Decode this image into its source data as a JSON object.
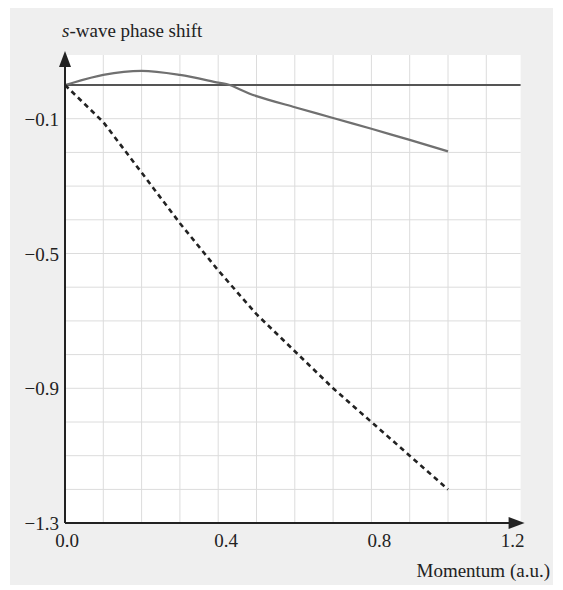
{
  "chart_data": {
    "type": "line",
    "title": "",
    "ylabel": "s-wave phase shift",
    "ylabel_italic_prefix": "s",
    "ylabel_rest": "-wave phase shift",
    "xlabel": "Momentum (a.u.)",
    "xlim": [
      0.0,
      1.2
    ],
    "ylim": [
      -1.3,
      0.05
    ],
    "x_ticks": [
      0.0,
      0.4,
      0.8,
      1.2
    ],
    "x_tick_labels": [
      "0.0",
      "0.4",
      "0.8",
      "1.2"
    ],
    "y_ticks": [
      -0.1,
      -0.5,
      -0.9,
      -1.3
    ],
    "y_tick_labels": [
      "−0.1",
      "−0.5",
      "−0.9",
      "−1.3"
    ],
    "grid": true,
    "grid_x_step": 0.1,
    "grid_y_step": 0.1,
    "legend": null,
    "series": [
      {
        "name": "zero reference",
        "style": "solid",
        "color": "#555555",
        "x": [
          0.0,
          1.2
        ],
        "y": [
          0.0,
          0.0
        ]
      },
      {
        "name": "solid curve",
        "style": "solid",
        "color": "#707070",
        "x": [
          0.0,
          0.1,
          0.2,
          0.3,
          0.4,
          0.43,
          0.5,
          0.6,
          0.7,
          0.8,
          0.9,
          1.0
        ],
        "y": [
          0.0,
          0.03,
          0.042,
          0.03,
          0.007,
          0.0,
          -0.033,
          -0.066,
          -0.098,
          -0.13,
          -0.163,
          -0.197
        ]
      },
      {
        "name": "dashed curve",
        "style": "dashed",
        "color": "#222222",
        "x": [
          0.0,
          0.1,
          0.2,
          0.3,
          0.4,
          0.5,
          0.6,
          0.7,
          0.8,
          0.9,
          1.0
        ],
        "y": [
          0.0,
          -0.11,
          -0.26,
          -0.41,
          -0.55,
          -0.68,
          -0.79,
          -0.9,
          -1.0,
          -1.1,
          -1.2
        ]
      }
    ]
  },
  "colors": {
    "frame_background": "#efefef",
    "plot_background": "#ffffff",
    "grid": "#dcdcdc",
    "axis": "#222222"
  }
}
